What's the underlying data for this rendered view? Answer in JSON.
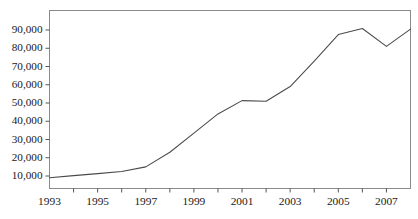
{
  "figure": {
    "top_crop_artifact": "g",
    "line_color": "#4a4a4a",
    "frame_color": "#8a8a8a",
    "axis_color": "#555555",
    "background_color": "#ffffff"
  },
  "chart_data": {
    "type": "line",
    "title": "",
    "subtitle": "",
    "xlabel": "",
    "ylabel": "",
    "x": [
      1993,
      1994,
      1995,
      1996,
      1997,
      1998,
      1999,
      2000,
      2001,
      2002,
      2003,
      2004,
      2005,
      2006,
      2007,
      2008
    ],
    "values": [
      9000,
      10200,
      11300,
      12500,
      15000,
      23000,
      33500,
      44000,
      51300,
      51000,
      59000,
      73000,
      87500,
      90800,
      81000,
      90500
    ],
    "series": [
      {
        "name": "",
        "values": [
          9000,
          10200,
          11300,
          12500,
          15000,
          23000,
          33500,
          44000,
          51300,
          51000,
          59000,
          73000,
          87500,
          90800,
          81000,
          90500
        ]
      }
    ],
    "xlim": [
      1993,
      2008
    ],
    "ylim": [
      0,
      100000
    ],
    "grid": false,
    "legend": null,
    "legend_position": "none",
    "y_ticks": [
      10000,
      20000,
      30000,
      40000,
      50000,
      60000,
      70000,
      80000,
      90000
    ],
    "y_tick_labels": [
      "10,000",
      "20,000",
      "30,000",
      "40,000",
      "50,000",
      "60,000",
      "70,000",
      "80,000",
      "90,000"
    ],
    "x_ticks": [
      1993,
      1995,
      1997,
      1999,
      2001,
      2003,
      2005,
      2007
    ],
    "x_tick_labels": [
      "1993",
      "1995",
      "1997",
      "1999",
      "2001",
      "2003",
      "2005",
      "2007"
    ],
    "x_minor_ticks": [
      1994,
      1996,
      1998,
      2000,
      2002,
      2004,
      2006,
      2008
    ],
    "annotations": []
  }
}
